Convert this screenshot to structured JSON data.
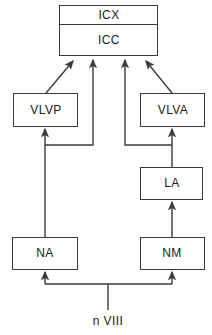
{
  "diagram": {
    "type": "block-flow-diagram",
    "title": "",
    "background_color": "#ffffff",
    "stroke_color": "#3a3a3a",
    "text_color": "#1a1a1a",
    "nodes": [
      {
        "id": "icx",
        "label": "ICX",
        "x": 59,
        "y": 5,
        "w": 99,
        "h": 20
      },
      {
        "id": "icc",
        "label": "ICC",
        "x": 59,
        "y": 25,
        "w": 99,
        "h": 31
      },
      {
        "id": "vlvp",
        "label": "VLVP",
        "x": 13,
        "y": 93,
        "w": 65,
        "h": 34
      },
      {
        "id": "vlva",
        "label": "VLVA",
        "x": 140,
        "y": 93,
        "w": 65,
        "h": 34
      },
      {
        "id": "la",
        "label": "LA",
        "x": 140,
        "y": 167,
        "w": 63,
        "h": 33
      },
      {
        "id": "na",
        "label": "NA",
        "x": 12,
        "y": 237,
        "w": 66,
        "h": 33
      },
      {
        "id": "nm",
        "label": "NM",
        "x": 140,
        "y": 237,
        "w": 65,
        "h": 33
      }
    ],
    "input_label": "n VIII",
    "edges": [
      {
        "from": "vlvp",
        "to": "icc",
        "kind": "diagonal-arrow"
      },
      {
        "from": "na",
        "to": "icc",
        "kind": "elbow-arrow"
      },
      {
        "from": "nm",
        "to": "icc",
        "kind": "elbow-arrow"
      },
      {
        "from": "vlva",
        "to": "icc",
        "kind": "diagonal-arrow"
      },
      {
        "from": "na",
        "to": "vlvp",
        "kind": "vertical-arrow"
      },
      {
        "from": "la",
        "to": "vlva",
        "kind": "vertical-arrow"
      },
      {
        "from": "nm",
        "to": "la",
        "kind": "vertical-arrow"
      },
      {
        "from": "nVIII",
        "to": "na",
        "kind": "elbow-arrow"
      },
      {
        "from": "nVIII",
        "to": "nm",
        "kind": "elbow-arrow"
      }
    ]
  }
}
